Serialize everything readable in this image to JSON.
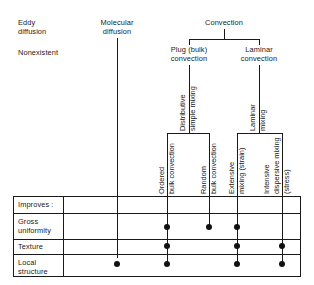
{
  "figure": {
    "title_nodes": {
      "eddy": "Eddy\ndiffusion",
      "eddy_line1": "Eddy",
      "eddy_line2": "diffusion",
      "eddy_status": "Nonexistent",
      "molecular_line1": "Molecular",
      "molecular_line2": "diffusion",
      "convection": "Convection",
      "plug_line1": "Plug (bulk)",
      "plug_line2": "convection",
      "laminar_line1": "Laminar",
      "laminar_line2": "convection"
    },
    "branch_labels": {
      "plug_mech_line1": "Distributive",
      "plug_mech_line2": "simple mixing",
      "laminar_mech_line1": "Laminar",
      "laminar_mech_line2": "mixing"
    },
    "leaf_labels": [
      {
        "id": "ordered-bulk-convection",
        "line1": "Ordered",
        "line2": "bulk convection"
      },
      {
        "id": "random-bulk-convection",
        "line1": "Random",
        "line2": "bulk convection"
      },
      {
        "id": "extensive-mixing-strain",
        "line1": "Extensive",
        "line2": "mixing (strain)"
      },
      {
        "id": "intensive-dispersive-mixing-stress",
        "line1": "Intensive",
        "line2": "dispersive mixing",
        "line3": "(stress)"
      }
    ]
  },
  "table": {
    "header_label": "Improves :",
    "rows": [
      {
        "id": "gross-uniformity",
        "line1": "Gross",
        "line2": "uniformity"
      },
      {
        "id": "texture",
        "line1": "Texture",
        "line2": ""
      },
      {
        "id": "local-structure",
        "line1": "Local",
        "line2": "structure"
      }
    ],
    "columns": [
      "eddy-diffusion",
      "molecular-diffusion",
      "ordered-bulk-convection",
      "random-bulk-convection",
      "extensive-mixing-strain",
      "intensive-dispersive-mixing-stress"
    ],
    "marks": {
      "gross-uniformity": [
        "ordered-bulk-convection",
        "random-bulk-convection",
        "extensive-mixing-strain"
      ],
      "texture": [
        "ordered-bulk-convection",
        "extensive-mixing-strain",
        "intensive-dispersive-mixing-stress"
      ],
      "local-structure": [
        "molecular-diffusion",
        "ordered-bulk-convection",
        "extensive-mixing-strain",
        "intensive-dispersive-mixing-stress"
      ]
    }
  },
  "style": {
    "ink": "#1a1a1a",
    "dot": "#111111",
    "background": "#ffffff"
  }
}
